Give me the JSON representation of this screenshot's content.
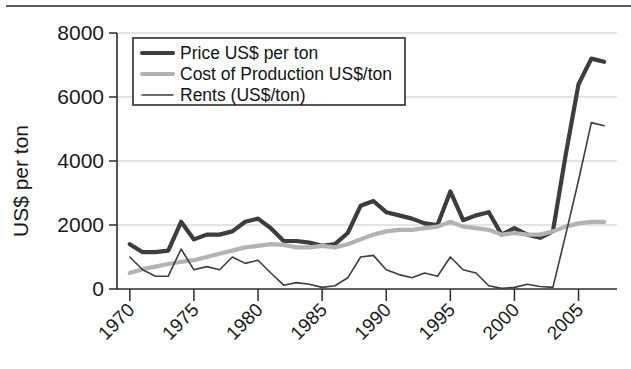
{
  "figure": {
    "background_color": "#ffffff",
    "has_top_rule": true
  },
  "chart_data": {
    "type": "line",
    "title": "",
    "subtitle": "",
    "xlabel": "",
    "ylabel": "US$ per ton",
    "xlim": [
      1969,
      2008
    ],
    "ylim": [
      0,
      8000
    ],
    "grid": true,
    "grid_axis": "y",
    "legend_position": "top-left-inside",
    "x_ticks": [
      1970,
      1975,
      1980,
      1985,
      1990,
      1995,
      2000,
      2005
    ],
    "x_tick_labels": [
      "1970",
      "1975",
      "1980",
      "1985",
      "1990",
      "1995",
      "2000",
      "2005"
    ],
    "x_tick_rotation": 45,
    "y_ticks": [
      0,
      2000,
      4000,
      6000,
      8000
    ],
    "y_tick_labels": [
      "0",
      "2000",
      "4000",
      "6000",
      "8000"
    ],
    "x": [
      1970,
      1971,
      1972,
      1973,
      1974,
      1975,
      1976,
      1977,
      1978,
      1979,
      1980,
      1981,
      1982,
      1983,
      1984,
      1985,
      1986,
      1987,
      1988,
      1989,
      1990,
      1991,
      1992,
      1993,
      1994,
      1995,
      1996,
      1997,
      1998,
      1999,
      2000,
      2001,
      2002,
      2003,
      2004,
      2005,
      2006,
      2007
    ],
    "series": [
      {
        "name": "Price US$ per ton",
        "color": "#3d3d3d",
        "line_width": "thick",
        "values": [
          1400,
          1150,
          1150,
          1200,
          2100,
          1550,
          1700,
          1700,
          1800,
          2100,
          2200,
          1900,
          1500,
          1500,
          1450,
          1350,
          1400,
          1750,
          2600,
          2750,
          2400,
          2300,
          2200,
          2050,
          2000,
          3050,
          2150,
          2300,
          2400,
          1700,
          1900,
          1700,
          1600,
          1800,
          4200,
          6400,
          7200,
          7100
        ]
      },
      {
        "name": "Cost of Production US$/ton",
        "color": "#b3b3b3",
        "line_width": "thick",
        "values": [
          500,
          620,
          700,
          780,
          850,
          900,
          1000,
          1100,
          1200,
          1300,
          1350,
          1400,
          1380,
          1300,
          1300,
          1350,
          1300,
          1400,
          1550,
          1700,
          1800,
          1850,
          1850,
          1900,
          1950,
          2100,
          1950,
          1900,
          1850,
          1700,
          1750,
          1700,
          1700,
          1800,
          1950,
          2050,
          2100,
          2100
        ]
      },
      {
        "name": "Rents (US$/ton)",
        "color": "#3d3d3d",
        "line_width": "thin",
        "values": [
          1000,
          600,
          400,
          400,
          1250,
          600,
          700,
          600,
          1000,
          800,
          900,
          500,
          120,
          200,
          150,
          50,
          100,
          350,
          1000,
          1050,
          600,
          450,
          350,
          500,
          400,
          1000,
          600,
          500,
          100,
          20,
          50,
          150,
          80,
          50,
          1700,
          3400,
          5200,
          5100
        ]
      }
    ],
    "legend": [
      {
        "label": "Price US$ per ton",
        "color": "#3d3d3d",
        "line_width": "thick"
      },
      {
        "label": "Cost of Production US$/ton",
        "color": "#b3b3b3",
        "line_width": "thick"
      },
      {
        "label": "Rents (US$/ton)",
        "color": "#3d3d3d",
        "line_width": "thin"
      }
    ]
  }
}
